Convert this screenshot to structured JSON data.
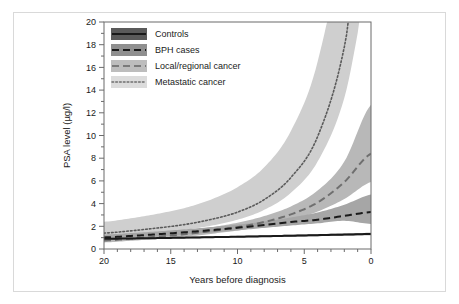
{
  "figure": {
    "background": "#ffffff",
    "frame_color": "#d9d9d9"
  },
  "chart_data": {
    "type": "line",
    "title": "",
    "subtitle": "",
    "xlabel": "Years before diagnosis",
    "ylabel": "PSA level (µg/l)",
    "xlim": [
      20,
      0
    ],
    "ylim": [
      0,
      20
    ],
    "x_reversed": true,
    "grid": false,
    "legend_position": "top-left-inside",
    "xticks": [
      20,
      15,
      10,
      5,
      0
    ],
    "xticklabels": [
      "20",
      "15",
      "10",
      "5",
      "0"
    ],
    "x_minor_tick_step": 1,
    "yticks": [
      0,
      2,
      4,
      6,
      8,
      10,
      12,
      14,
      16,
      18,
      20
    ],
    "yticklabels": [
      "0",
      "2",
      "4",
      "6",
      "8",
      "10",
      "12",
      "14",
      "16",
      "18",
      "20"
    ],
    "y_minor_tick_step": 1,
    "x": [
      20,
      18,
      16,
      14,
      12,
      10,
      8,
      6,
      4,
      2,
      0
    ],
    "series": [
      {
        "name": "Controls",
        "line_style": "solid",
        "line_color": "#1a1a1a",
        "band_color": "#8c8c8c",
        "values": [
          0.9,
          0.93,
          0.96,
          1.0,
          1.04,
          1.08,
          1.12,
          1.17,
          1.22,
          1.27,
          1.32
        ],
        "band_lower": [
          0.83,
          0.86,
          0.9,
          0.93,
          0.97,
          1.01,
          1.05,
          1.09,
          1.13,
          1.18,
          1.22
        ],
        "band_upper": [
          0.97,
          1.01,
          1.04,
          1.08,
          1.12,
          1.16,
          1.21,
          1.26,
          1.31,
          1.37,
          1.43
        ]
      },
      {
        "name": "BPH cases",
        "line_style": "dashed",
        "line_color": "#1a1a1a",
        "band_color": "#a6a6a6",
        "values": [
          1.02,
          1.15,
          1.3,
          1.47,
          1.66,
          1.87,
          2.11,
          2.38,
          2.58,
          2.92,
          3.25
        ],
        "band_lower": [
          0.8,
          0.95,
          1.1,
          1.26,
          1.44,
          1.64,
          1.86,
          2.07,
          2.26,
          2.48,
          2.2
        ],
        "band_upper": [
          1.28,
          1.4,
          1.55,
          1.73,
          1.93,
          2.15,
          2.42,
          2.78,
          3.22,
          3.9,
          4.8
        ]
      },
      {
        "name": "Local/regional cancer",
        "line_style": "dashed",
        "line_color": "#6f6f6f",
        "band_color": "#b8b8b8",
        "values": [
          0.75,
          0.9,
          1.08,
          1.3,
          1.58,
          1.92,
          2.38,
          3.05,
          4.1,
          5.9,
          8.4
        ],
        "band_lower": [
          0.58,
          0.72,
          0.88,
          1.08,
          1.33,
          1.63,
          2.02,
          2.55,
          3.3,
          4.4,
          5.9
        ],
        "band_upper": [
          0.95,
          1.12,
          1.32,
          1.58,
          1.9,
          2.32,
          2.9,
          3.75,
          5.15,
          7.7,
          12.7
        ]
      },
      {
        "name": "Metastatic cancer",
        "line_style": "dotted",
        "line_color": "#5a5a5a",
        "band_color": "#cfcfcf",
        "values": [
          1.4,
          1.6,
          1.85,
          2.15,
          2.6,
          3.25,
          4.35,
          6.3,
          9.9,
          17.8,
          33.0
        ],
        "band_lower": [
          1.0,
          1.18,
          1.4,
          1.68,
          2.05,
          2.58,
          3.45,
          4.95,
          7.7,
          13.3,
          24.0
        ],
        "band_upper": [
          2.4,
          2.7,
          3.1,
          3.6,
          4.35,
          5.45,
          7.2,
          10.4,
          16.5,
          29.0,
          52.0
        ]
      }
    ],
    "legend": [
      {
        "label": "Controls",
        "line_style": "solid",
        "line_color": "#1a1a1a",
        "band_color": "#5a5a5a"
      },
      {
        "label": "BPH cases",
        "line_style": "dashed",
        "line_color": "#1a1a1a",
        "band_color": "#8f8f8f"
      },
      {
        "label": "Local/regional cancer",
        "line_style": "dashed",
        "line_color": "#7a7a7a",
        "band_color": "#bdbdbd"
      },
      {
        "label": "Metastatic cancer",
        "line_style": "dotted",
        "line_color": "#6e6e6e",
        "band_color": "#dcdcdc"
      }
    ]
  }
}
